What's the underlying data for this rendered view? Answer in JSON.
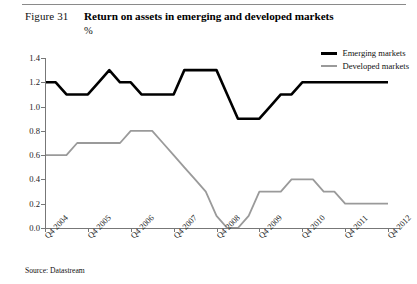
{
  "figure": {
    "label": "Figure 31",
    "title": "Return on assets in emerging and developed markets",
    "subtitle": "%",
    "source": "Source: Datastream"
  },
  "legend": {
    "position": "top-right",
    "items": [
      {
        "name": "Emerging markets",
        "color": "#000000",
        "width": 3
      },
      {
        "name": "Developed markets",
        "color": "#9a9a9a",
        "width": 2
      }
    ]
  },
  "chart_data": {
    "type": "line",
    "title": "Return on assets in emerging and developed markets",
    "subtitle": "%",
    "xlabel": "",
    "ylabel": "%",
    "ylim": [
      0.0,
      1.4
    ],
    "yticks": [
      "0.0",
      "0.2",
      "0.4",
      "0.6",
      "0.8",
      "1.0",
      "1.2",
      "1.4"
    ],
    "ytick_values": [
      0.0,
      0.2,
      0.4,
      0.6,
      0.8,
      1.0,
      1.2,
      1.4
    ],
    "grid": false,
    "legend_position": "top-right",
    "x_tick_labels": [
      "Q4 2004",
      "Q4 2005",
      "Q4 2006",
      "Q4 2007",
      "Q4 2008",
      "Q4 2009",
      "Q4 2010",
      "Q4 2011",
      "Q4 2012"
    ],
    "x_tick_indices": [
      0,
      4,
      8,
      12,
      16,
      20,
      24,
      28,
      32
    ],
    "x": [
      "Q4 2004",
      "Q1 2005",
      "Q2 2005",
      "Q3 2005",
      "Q4 2005",
      "Q1 2006",
      "Q2 2006",
      "Q3 2006",
      "Q4 2006",
      "Q1 2007",
      "Q2 2007",
      "Q3 2007",
      "Q4 2007",
      "Q1 2008",
      "Q2 2008",
      "Q3 2008",
      "Q4 2008",
      "Q1 2009",
      "Q2 2009",
      "Q3 2009",
      "Q4 2009",
      "Q1 2010",
      "Q2 2010",
      "Q3 2010",
      "Q4 2010",
      "Q1 2011",
      "Q2 2011",
      "Q3 2011",
      "Q4 2011",
      "Q1 2012",
      "Q2 2012",
      "Q3 2012",
      "Q4 2012"
    ],
    "series": [
      {
        "name": "Emerging markets",
        "color": "#000000",
        "values": [
          1.2,
          1.2,
          1.1,
          1.1,
          1.1,
          1.2,
          1.3,
          1.2,
          1.2,
          1.1,
          1.1,
          1.1,
          1.1,
          1.3,
          1.3,
          1.3,
          1.3,
          1.1,
          0.9,
          0.9,
          0.9,
          1.0,
          1.1,
          1.1,
          1.2,
          1.2,
          1.2,
          1.2,
          1.2,
          1.2,
          1.2,
          1.2,
          1.2
        ]
      },
      {
        "name": "Developed markets",
        "color": "#9a9a9a",
        "values": [
          0.6,
          0.6,
          0.6,
          0.7,
          0.7,
          0.7,
          0.7,
          0.7,
          0.8,
          0.8,
          0.8,
          0.7,
          0.6,
          0.5,
          0.4,
          0.3,
          0.1,
          0.0,
          0.0,
          0.1,
          0.3,
          0.3,
          0.3,
          0.4,
          0.4,
          0.4,
          0.3,
          0.3,
          0.2,
          0.2,
          0.2,
          0.2,
          0.2
        ]
      }
    ]
  }
}
